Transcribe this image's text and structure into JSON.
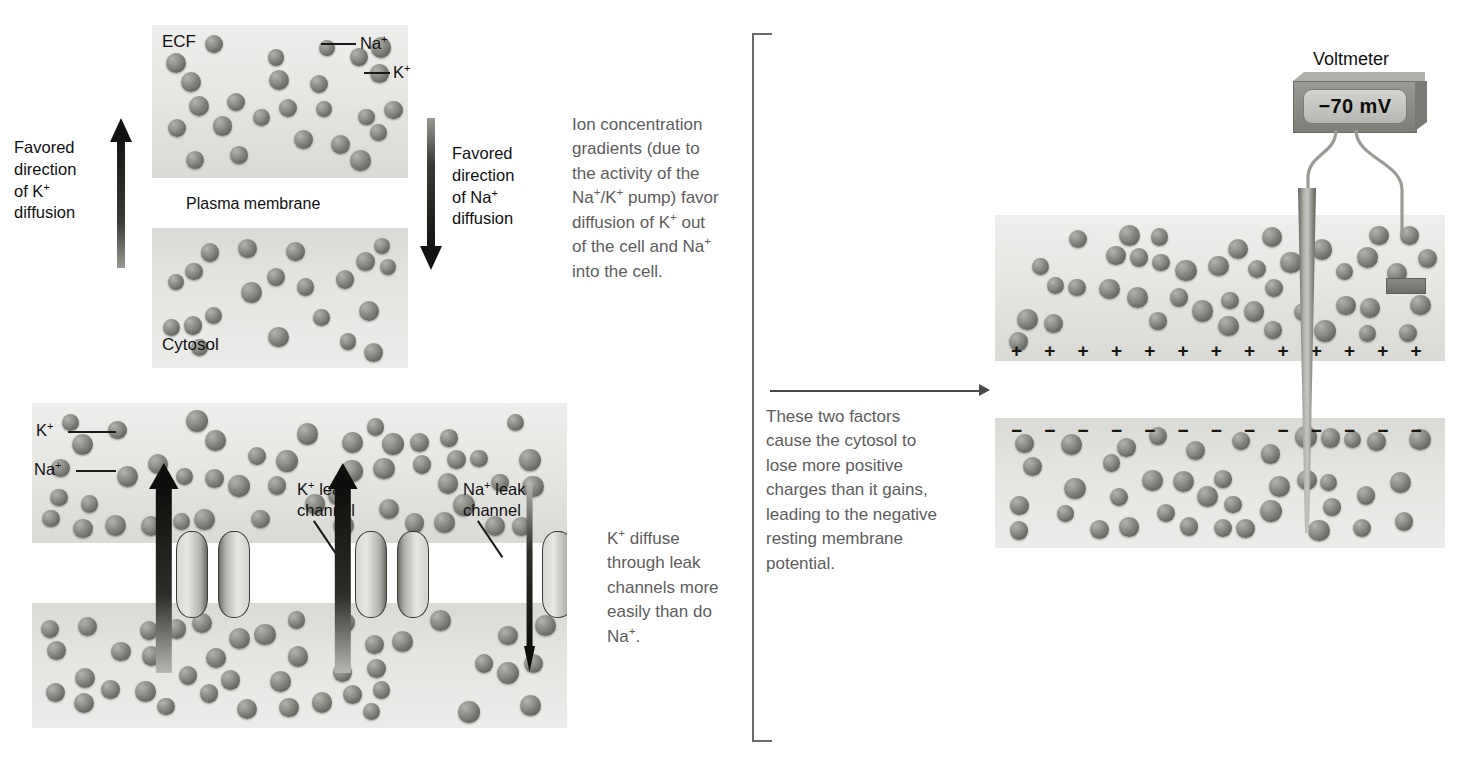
{
  "figure": {
    "domain": "biology-diagram"
  },
  "panel_top_left": {
    "name": "ion-gradient-panel",
    "ecf_label": "ECF",
    "cytosol_label": "Cytosol",
    "membrane_label": "Plasma membrane",
    "ion_na_label": "Na+",
    "ion_k_label": "K+",
    "arrow_left_text": "Favored\ndirection\nof K+\ndiffusion",
    "arrow_right_text": "Favored\ndirection\nof Na+\ndiffusion",
    "arrow_left_direction": "up",
    "arrow_right_direction": "down"
  },
  "callout_top": {
    "name": "ion-gradient-callout",
    "text": "Ion concentration\ngradients (due to\nthe activity of the\nNa+/K+ pump) favor\ndiffusion of K+ out\nof the cell and Na+\ninto the cell."
  },
  "panel_bottom_left": {
    "name": "leak-channel-panel",
    "ion_k_label": "K+",
    "ion_na_label": "Na+",
    "k_channel_label": "K+ leak\nchannel",
    "na_channel_label": "Na+ leak\nchannel",
    "arrow_directions": [
      "up",
      "up",
      "down"
    ]
  },
  "callout_bottom": {
    "name": "leak-diffusion-callout",
    "text": "K+ diffuse\nthrough leak\nchannels more\neasily than do\nNa+."
  },
  "bracket": {
    "name": "summary-bracket",
    "callout_text": "These two factors\ncause the cytosol to\nlose more positive\ncharges than it gains,\nleading to the negative\nresting membrane\npotential."
  },
  "panel_right": {
    "name": "membrane-potential-panel",
    "voltmeter_label": "Voltmeter",
    "voltmeter_reading": "−70 mV",
    "charge_positive": "+",
    "charge_negative": "−",
    "positive_charge_count": 13,
    "negative_charge_count": 13
  },
  "colors": {
    "ion": "#6e6e68",
    "fluid_light": "#eeeeec",
    "fluid_dark": "#d9d9d5",
    "membrane": "#a9a9a4",
    "text": "#111111",
    "callout_text": "#5d5d5d",
    "bracket": "#6a6a6a",
    "arrow": "#141414"
  }
}
